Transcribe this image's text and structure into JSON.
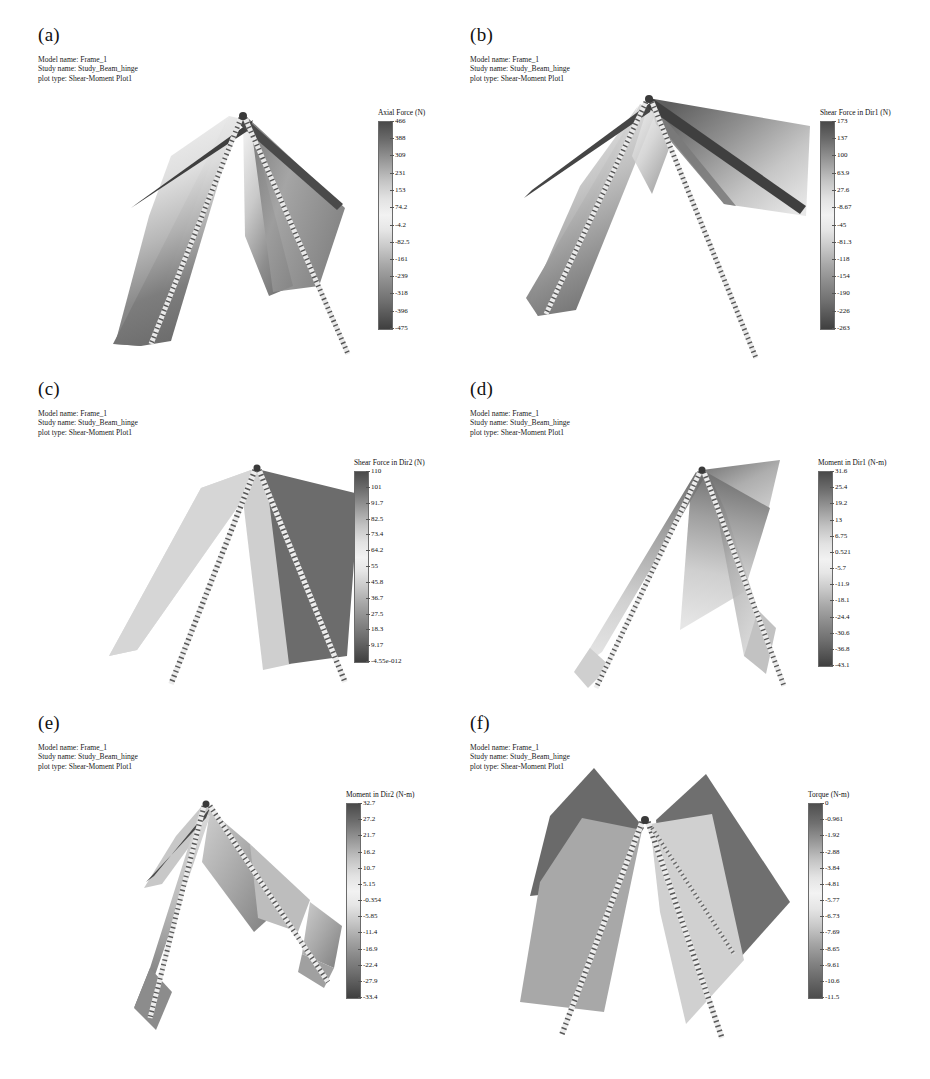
{
  "figure": {
    "background": "#ffffff",
    "colormap": "rainbow-grayscale",
    "note": "Six FEA shear-moment plot panels of an A-frame beam-hinge structure"
  },
  "meta_lines": {
    "model_name": "Model name: Frame_1",
    "study_name": "Study name: Study_Beam_hinge",
    "plot_type": "plot type: Shear-Moment Plot1"
  },
  "panels": [
    {
      "label": "(a)",
      "legend_title": "Axial Force (N)",
      "ticks": [
        "466",
        "388",
        "309",
        "231",
        "153",
        "74.2",
        "-4.2",
        "-82.5",
        "-161",
        "-239",
        "-318",
        "-396",
        "-475"
      ]
    },
    {
      "label": "(b)",
      "legend_title": "Shear Force in Dir1 (N)",
      "ticks": [
        "173",
        "137",
        "100",
        "63.9",
        "27.6",
        "-8.67",
        "-45",
        "-81.3",
        "-118",
        "-154",
        "-190",
        "-226",
        "-263"
      ]
    },
    {
      "label": "(c)",
      "legend_title": "Shear Force in Dir2 (N)",
      "ticks": [
        "110",
        "101",
        "91.7",
        "82.5",
        "73.4",
        "64.2",
        "55",
        "45.8",
        "36.7",
        "27.5",
        "18.3",
        "9.17",
        "-4.55e-012"
      ]
    },
    {
      "label": "(d)",
      "legend_title": "Moment in Dir1 (N-m)",
      "ticks": [
        "31.6",
        "25.4",
        "19.2",
        "13",
        "6.75",
        "0.521",
        "-5.7",
        "-11.9",
        "-18.1",
        "-24.4",
        "-30.6",
        "-36.8",
        "-43.1"
      ]
    },
    {
      "label": "(e)",
      "legend_title": "Moment in Dir2 (N-m)",
      "ticks": [
        "32.7",
        "27.2",
        "21.7",
        "16.2",
        "10.7",
        "5.15",
        "-0.354",
        "-5.85",
        "-11.4",
        "-16.9",
        "-22.4",
        "-27.9",
        "-33.4"
      ]
    },
    {
      "label": "(f)",
      "legend_title": "Torque (N-m)",
      "ticks": [
        "0",
        "-0.961",
        "-1.92",
        "-2.88",
        "-3.84",
        "-4.81",
        "-5.77",
        "-6.73",
        "-7.69",
        "-8.65",
        "-9.61",
        "-10.6",
        "-11.5"
      ]
    }
  ]
}
